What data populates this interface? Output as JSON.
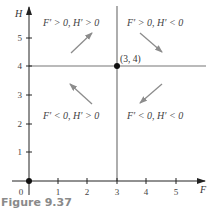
{
  "figure": {
    "caption": "Figure 9.37",
    "x_axis_label": "F",
    "y_axis_label": "H",
    "origin_label": "0",
    "x_ticks": [
      "1",
      "2",
      "3",
      "4",
      "5"
    ],
    "y_ticks": [
      "1",
      "2",
      "3",
      "4",
      "5"
    ],
    "equilibrium_point_label": "(3, 4)",
    "regions": {
      "top_left": "F′ > 0, H′ > 0",
      "top_right": "F′ > 0, H′ < 0",
      "bottom_left": "F′ < 0, H′ > 0",
      "bottom_right": "F′ < 0, H′ < 0"
    },
    "arrows": {
      "top_left": "up-right",
      "top_right": "down-right",
      "bottom_left": "up-left",
      "bottom_right": "down-left"
    },
    "colors": {
      "axis": "#222222",
      "nullcline": "#777777",
      "arrow": "#8c8c8c",
      "caption": "#8a8a8a"
    }
  }
}
